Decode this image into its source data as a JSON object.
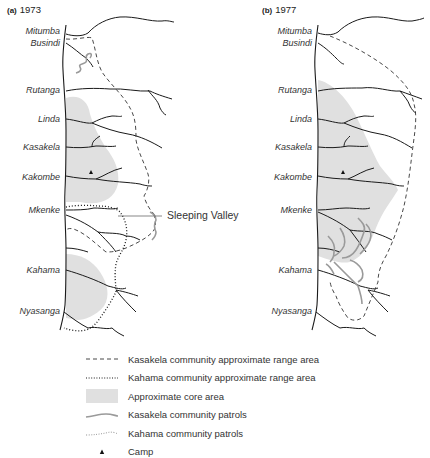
{
  "figure": {
    "panels": [
      {
        "id": "a",
        "label": "(a)",
        "year": "1973",
        "places": [
          "Mitumba",
          "Busindi",
          "Rutanga",
          "Linda",
          "Kasakela",
          "Kakombe",
          "Mkenke",
          "Kahama",
          "Nyasanga"
        ],
        "callout": "Sleeping Valley"
      },
      {
        "id": "b",
        "label": "(b)",
        "year": "1977",
        "places": [
          "Mitumba",
          "Busindi",
          "Rutanga",
          "Linda",
          "Kasakela",
          "Kakombe",
          "Mkenke",
          "Kahama",
          "Nyasanga"
        ]
      }
    ]
  },
  "legend": {
    "items": [
      {
        "symbol": "dashed-line",
        "label": "Kasakela community approximate range area"
      },
      {
        "symbol": "dotted-line",
        "label": "Kahama community approximate range area"
      },
      {
        "symbol": "grey-fill",
        "label": "Approximate core area"
      },
      {
        "symbol": "grey-wavy-line",
        "label": "Kasakela community patrols"
      },
      {
        "symbol": "dotted-wavy-line",
        "label": "Kahama community patrols"
      },
      {
        "symbol": "triangle",
        "label": "Camp"
      }
    ]
  },
  "colors": {
    "core_area": "#e0e0e0",
    "stream": "#1a1a1a",
    "patrol": "#9a9a9a",
    "text": "#333333"
  }
}
